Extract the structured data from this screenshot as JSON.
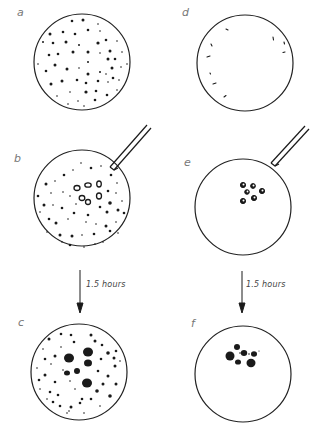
{
  "figure": {
    "panels": [
      {
        "id": "a",
        "label": "a",
        "description": "dish with many scattered small cells"
      },
      {
        "id": "b",
        "label": "b",
        "description": "dish with scattered cells and a few marked (ring) cells near a pipette"
      },
      {
        "id": "c",
        "label": "c",
        "description": "after incubation: large dark aggregates among scattered cells"
      },
      {
        "id": "d",
        "label": "d",
        "description": "nearly empty dish with a few cells at the rim"
      },
      {
        "id": "e",
        "label": "e",
        "description": "empty dish with a small cluster of ring cells placed by pipette"
      },
      {
        "id": "f",
        "label": "f",
        "description": "after incubation: cluster merged into dark aggregates"
      }
    ],
    "arrows": [
      {
        "from": "b",
        "to": "c",
        "label": "1.5 hours"
      },
      {
        "from": "e",
        "to": "f",
        "label": "1.5 hours"
      }
    ],
    "colors": {
      "ink": "#1a1a1a",
      "label": "#777777",
      "background": "#ffffff"
    }
  }
}
